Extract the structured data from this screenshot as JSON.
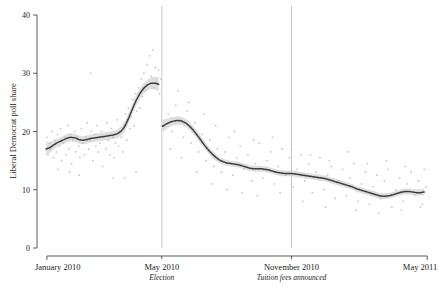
{
  "chart_data": {
    "type": "line",
    "title": "",
    "xlabel": "",
    "ylabel": "Liberal Democrat poll share",
    "ylim": [
      0,
      40
    ],
    "yticks": [
      0,
      10,
      20,
      30,
      40
    ],
    "ytick_labels": [
      "0",
      "10",
      "20",
      "30",
      "40"
    ],
    "xlim": [
      "January 2010",
      "May 2011"
    ],
    "xticks": [
      "January 2010",
      "May 2010",
      "November 2010",
      "May 2011"
    ],
    "xtick_labels": [
      "January 2010",
      "May 2010",
      "November 2010",
      "May 2011"
    ],
    "grid": false,
    "legend": "none",
    "annotations": [
      {
        "at": "May 2010",
        "label": "Election",
        "style": "italic",
        "vline": true
      },
      {
        "at": "November 2010",
        "label": "Tuition fees announced",
        "style": "italic",
        "vline": true
      }
    ],
    "series": [
      {
        "name": "smoothed poll share (pre-election)",
        "type": "line-with-ci",
        "x": [
          0.3,
          1.2,
          2.1,
          3.0,
          4.0,
          5.0,
          6.0,
          7.0,
          8.0,
          9.0,
          10.0,
          11.0,
          12.0,
          13.0,
          14.0,
          15.0,
          16.0,
          17.0,
          18.0,
          19.0,
          20.0,
          21.0,
          22.0,
          23.0,
          24.0,
          25.0,
          26.0,
          27.0,
          28.0,
          29.0,
          30.0
        ],
        "values": [
          17.0,
          17.2,
          17.6,
          18.0,
          18.3,
          18.6,
          18.9,
          19.0,
          18.9,
          18.6,
          18.5,
          18.6,
          18.8,
          18.9,
          19.0,
          19.1,
          19.2,
          19.3,
          19.4,
          19.6,
          20.0,
          20.8,
          22.2,
          23.8,
          25.3,
          26.5,
          27.4,
          28.0,
          28.3,
          28.3,
          28.1
        ],
        "ci_lower": [
          15.9,
          16.3,
          16.8,
          17.3,
          17.6,
          17.9,
          18.2,
          18.3,
          18.2,
          17.9,
          17.8,
          17.9,
          18.1,
          18.2,
          18.3,
          18.4,
          18.5,
          18.6,
          18.7,
          18.9,
          19.2,
          19.9,
          21.3,
          22.9,
          24.4,
          25.6,
          26.5,
          27.1,
          27.3,
          27.2,
          26.9
        ],
        "ci_upper": [
          18.1,
          18.1,
          18.4,
          18.7,
          19.0,
          19.3,
          19.6,
          19.7,
          19.6,
          19.3,
          19.2,
          19.3,
          19.5,
          19.6,
          19.7,
          19.8,
          19.9,
          20.0,
          20.1,
          20.3,
          20.8,
          21.7,
          23.1,
          24.7,
          26.2,
          27.4,
          28.3,
          28.9,
          29.3,
          29.4,
          29.3
        ]
      },
      {
        "name": "smoothed poll share (post-election)",
        "type": "line-with-ci",
        "x": [
          31.0,
          32.0,
          33.0,
          34.0,
          35.0,
          36.0,
          37.0,
          38.0,
          39.0,
          40.0,
          41.0,
          42.0,
          43.0,
          44.0,
          45.0,
          46.0,
          47.0,
          48.0,
          49.0,
          50.0,
          51.0,
          52.0,
          53.0,
          54.0,
          55.0,
          56.0,
          57.0,
          58.0,
          59.0,
          60.0,
          61.0,
          62.0,
          63.0,
          64.0,
          65.0,
          66.0,
          67.0,
          68.0,
          69.0,
          70.0,
          71.0,
          72.0,
          73.0,
          74.0,
          75.0,
          76.0,
          77.0,
          78.0,
          79.0,
          80.0,
          81.0,
          82.0,
          83.0,
          84.0,
          85.0,
          86.0,
          87.0,
          88.0,
          89.0,
          90.0,
          91.0,
          92.0,
          93.0,
          94.0,
          95.0,
          96.0,
          97.0,
          98.0,
          99.0,
          100.0
        ],
        "values": [
          20.9,
          21.3,
          21.6,
          21.8,
          21.9,
          21.8,
          21.5,
          21.0,
          20.3,
          19.5,
          18.6,
          17.7,
          16.9,
          16.2,
          15.6,
          15.1,
          14.8,
          14.6,
          14.5,
          14.4,
          14.3,
          14.1,
          13.9,
          13.7,
          13.6,
          13.6,
          13.6,
          13.5,
          13.4,
          13.2,
          13.0,
          12.9,
          12.8,
          12.8,
          12.8,
          12.7,
          12.6,
          12.5,
          12.4,
          12.3,
          12.2,
          12.1,
          12.0,
          11.9,
          11.7,
          11.5,
          11.3,
          11.1,
          10.9,
          10.7,
          10.5,
          10.2,
          10.0,
          9.8,
          9.6,
          9.4,
          9.2,
          9.0,
          8.9,
          8.9,
          9.0,
          9.2,
          9.4,
          9.6,
          9.7,
          9.7,
          9.6,
          9.5,
          9.5,
          9.6
        ],
        "ci_lower": [
          19.8,
          20.4,
          20.8,
          21.1,
          21.2,
          21.1,
          20.8,
          20.3,
          19.6,
          18.8,
          17.9,
          17.1,
          16.3,
          15.6,
          15.0,
          14.6,
          14.3,
          14.1,
          14.0,
          13.9,
          13.8,
          13.6,
          13.4,
          13.2,
          13.1,
          13.1,
          13.1,
          13.0,
          12.9,
          12.7,
          12.5,
          12.4,
          12.3,
          12.3,
          12.3,
          12.2,
          12.1,
          12.0,
          11.9,
          11.8,
          11.7,
          11.6,
          11.5,
          11.4,
          11.2,
          11.0,
          10.8,
          10.6,
          10.4,
          10.2,
          10.0,
          9.7,
          9.5,
          9.3,
          9.1,
          8.9,
          8.7,
          8.5,
          8.4,
          8.4,
          8.5,
          8.7,
          8.9,
          9.1,
          9.2,
          9.2,
          9.1,
          9.0,
          9.0,
          9.0
        ],
        "ci_upper": [
          22.0,
          22.2,
          22.4,
          22.5,
          22.6,
          22.5,
          22.2,
          21.7,
          21.0,
          20.2,
          19.3,
          18.3,
          17.5,
          16.8,
          16.2,
          15.6,
          15.3,
          15.1,
          15.0,
          14.9,
          14.8,
          14.6,
          14.4,
          14.2,
          14.1,
          14.1,
          14.1,
          14.0,
          13.9,
          13.7,
          13.5,
          13.4,
          13.3,
          13.3,
          13.3,
          13.2,
          13.1,
          13.0,
          12.9,
          12.8,
          12.7,
          12.6,
          12.5,
          12.4,
          12.2,
          12.0,
          11.8,
          11.6,
          11.4,
          11.2,
          11.0,
          10.7,
          10.5,
          10.3,
          10.1,
          9.9,
          9.7,
          9.5,
          9.4,
          9.4,
          9.5,
          9.7,
          9.9,
          10.1,
          10.2,
          10.2,
          10.1,
          10.1,
          10.1,
          10.2
        ]
      },
      {
        "name": "individual polls",
        "type": "scatter",
        "points": [
          [
            0.5,
            19.0
          ],
          [
            0.8,
            16.0
          ],
          [
            1.2,
            18.0
          ],
          [
            1.5,
            17.0
          ],
          [
            1.9,
            20.0
          ],
          [
            2.2,
            15.5
          ],
          [
            2.6,
            18.5
          ],
          [
            3.0,
            16.5
          ],
          [
            3.3,
            19.5
          ],
          [
            3.7,
            17.5
          ],
          [
            4.1,
            20.5
          ],
          [
            4.4,
            15.0
          ],
          [
            4.8,
            18.0
          ],
          [
            5.2,
            19.0
          ],
          [
            5.6,
            16.0
          ],
          [
            6.0,
            21.0
          ],
          [
            6.3,
            17.0
          ],
          [
            6.7,
            19.5
          ],
          [
            7.0,
            14.5
          ],
          [
            7.4,
            18.5
          ],
          [
            7.8,
            20.0
          ],
          [
            8.1,
            16.5
          ],
          [
            8.5,
            19.0
          ],
          [
            8.9,
            17.5
          ],
          [
            9.2,
            15.5
          ],
          [
            9.6,
            20.5
          ],
          [
            10.0,
            18.0
          ],
          [
            10.4,
            16.0
          ],
          [
            10.8,
            19.0
          ],
          [
            11.1,
            21.5
          ],
          [
            11.5,
            17.0
          ],
          [
            11.9,
            18.5
          ],
          [
            12.2,
            20.0
          ],
          [
            12.6,
            15.0
          ],
          [
            13.0,
            19.5
          ],
          [
            13.4,
            17.5
          ],
          [
            13.7,
            21.0
          ],
          [
            14.1,
            16.5
          ],
          [
            14.5,
            18.0
          ],
          [
            14.9,
            20.0
          ],
          [
            15.2,
            14.0
          ],
          [
            15.6,
            19.0
          ],
          [
            16.0,
            17.0
          ],
          [
            16.4,
            21.5
          ],
          [
            16.7,
            18.5
          ],
          [
            17.1,
            16.0
          ],
          [
            17.5,
            20.5
          ],
          [
            17.9,
            19.0
          ],
          [
            18.2,
            15.5
          ],
          [
            18.6,
            18.0
          ],
          [
            19.0,
            22.0
          ],
          [
            19.4,
            17.5
          ],
          [
            19.7,
            20.0
          ],
          [
            20.1,
            19.0
          ],
          [
            20.5,
            16.5
          ],
          [
            20.9,
            21.0
          ],
          [
            21.2,
            23.0
          ],
          [
            21.6,
            18.5
          ],
          [
            22.0,
            24.0
          ],
          [
            22.4,
            20.5
          ],
          [
            22.7,
            22.5
          ],
          [
            23.1,
            25.5
          ],
          [
            23.5,
            21.0
          ],
          [
            23.9,
            26.5
          ],
          [
            24.2,
            23.5
          ],
          [
            24.6,
            27.5
          ],
          [
            25.0,
            24.0
          ],
          [
            25.4,
            29.0
          ],
          [
            25.7,
            26.0
          ],
          [
            26.1,
            30.0
          ],
          [
            26.5,
            27.0
          ],
          [
            26.9,
            31.5
          ],
          [
            27.2,
            28.0
          ],
          [
            27.6,
            33.0
          ],
          [
            28.0,
            29.5
          ],
          [
            28.4,
            34.0
          ],
          [
            28.7,
            27.5
          ],
          [
            29.1,
            31.0
          ],
          [
            29.5,
            28.5
          ],
          [
            29.9,
            30.5
          ],
          [
            30.2,
            26.5
          ],
          [
            30.6,
            29.0
          ],
          [
            12.0,
            30.0
          ],
          [
            18.0,
            12.0
          ],
          [
            24.0,
            13.0
          ],
          [
            9.0,
            12.5
          ],
          [
            6.5,
            13.0
          ],
          [
            3.5,
            13.5
          ],
          [
            21.0,
            12.0
          ],
          [
            31.5,
            21.0
          ],
          [
            32.5,
            23.0
          ],
          [
            33.5,
            20.0
          ],
          [
            34.5,
            24.5
          ],
          [
            35.5,
            22.0
          ],
          [
            36.5,
            19.0
          ],
          [
            37.5,
            23.5
          ],
          [
            38.5,
            18.0
          ],
          [
            39.5,
            21.5
          ],
          [
            40.5,
            16.5
          ],
          [
            41.5,
            19.5
          ],
          [
            42.5,
            15.0
          ],
          [
            43.5,
            18.5
          ],
          [
            44.5,
            14.0
          ],
          [
            45.5,
            17.0
          ],
          [
            46.5,
            13.0
          ],
          [
            47.5,
            16.5
          ],
          [
            48.5,
            19.0
          ],
          [
            49.5,
            12.5
          ],
          [
            50.5,
            15.5
          ],
          [
            51.5,
            17.5
          ],
          [
            52.5,
            13.5
          ],
          [
            53.5,
            16.0
          ],
          [
            54.5,
            11.5
          ],
          [
            55.5,
            14.5
          ],
          [
            56.5,
            18.0
          ],
          [
            57.5,
            12.0
          ],
          [
            58.5,
            15.0
          ],
          [
            59.5,
            16.5
          ],
          [
            60.5,
            11.0
          ],
          [
            61.5,
            14.0
          ],
          [
            62.5,
            17.0
          ],
          [
            63.5,
            12.5
          ],
          [
            64.5,
            15.5
          ],
          [
            65.5,
            10.5
          ],
          [
            66.5,
            13.5
          ],
          [
            67.5,
            16.0
          ],
          [
            68.5,
            11.5
          ],
          [
            69.5,
            14.5
          ],
          [
            70.5,
            9.5
          ],
          [
            71.5,
            13.0
          ],
          [
            72.5,
            15.5
          ],
          [
            73.5,
            10.0
          ],
          [
            74.5,
            12.5
          ],
          [
            75.5,
            14.0
          ],
          [
            76.5,
            8.5
          ],
          [
            77.5,
            11.5
          ],
          [
            78.5,
            13.5
          ],
          [
            79.5,
            9.0
          ],
          [
            80.5,
            12.0
          ],
          [
            81.5,
            14.5
          ],
          [
            82.5,
            8.0
          ],
          [
            83.5,
            11.0
          ],
          [
            84.5,
            13.0
          ],
          [
            85.5,
            7.5
          ],
          [
            86.5,
            10.5
          ],
          [
            87.5,
            12.5
          ],
          [
            88.5,
            8.5
          ],
          [
            89.5,
            11.5
          ],
          [
            90.5,
            13.5
          ],
          [
            91.5,
            7.0
          ],
          [
            92.5,
            10.0
          ],
          [
            93.5,
            12.0
          ],
          [
            94.5,
            8.0
          ],
          [
            95.5,
            11.0
          ],
          [
            96.5,
            13.0
          ],
          [
            97.5,
            9.0
          ],
          [
            98.5,
            11.5
          ],
          [
            99.5,
            7.5
          ],
          [
            100.5,
            10.5
          ],
          [
            35.0,
            27.0
          ],
          [
            38.0,
            25.0
          ],
          [
            42.0,
            23.0
          ],
          [
            45.0,
            21.0
          ],
          [
            50.0,
            20.0
          ],
          [
            55.0,
            18.5
          ],
          [
            60.0,
            19.0
          ],
          [
            65.0,
            17.0
          ],
          [
            70.0,
            16.0
          ],
          [
            75.0,
            15.0
          ],
          [
            80.0,
            16.5
          ],
          [
            85.0,
            14.5
          ],
          [
            90.0,
            15.0
          ],
          [
            95.0,
            14.0
          ],
          [
            100.0,
            13.5
          ],
          [
            33.0,
            17.0
          ],
          [
            36.0,
            15.5
          ],
          [
            40.0,
            13.0
          ],
          [
            44.0,
            11.0
          ],
          [
            48.0,
            10.0
          ],
          [
            52.0,
            9.5
          ],
          [
            56.0,
            9.0
          ],
          [
            62.0,
            9.5
          ],
          [
            68.0,
            8.0
          ],
          [
            74.0,
            7.0
          ],
          [
            82.0,
            6.5
          ],
          [
            88.0,
            6.0
          ],
          [
            94.0,
            6.5
          ],
          [
            99.0,
            7.0
          ]
        ]
      }
    ]
  },
  "axis": {
    "y_title": "Liberal Democrat poll share",
    "y_ticks": [
      "40",
      "30",
      "20",
      "10",
      "0"
    ],
    "x_ticks": [
      {
        "label": "January 2010",
        "sub": ""
      },
      {
        "label": "May 2010",
        "sub": "Election"
      },
      {
        "label": "November 2010",
        "sub": "Tuition fees announced"
      },
      {
        "label": "May 2011",
        "sub": ""
      }
    ]
  },
  "colors": {
    "line": "#3a3a3a",
    "band": "#c9c9c9",
    "points": "#bdbdbd",
    "axis": "#4a4a4a",
    "vline": "#b0b0b0",
    "text": "#1a1a1a",
    "background": "#ffffff"
  }
}
